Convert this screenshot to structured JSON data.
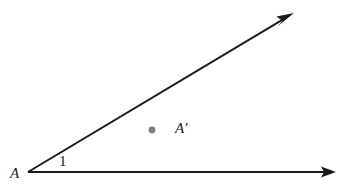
{
  "figure": {
    "background_color": "#ffffff",
    "stroke_color": "#1a1a1a",
    "point_color": "#808080",
    "labels": {
      "vertex": "A",
      "angle": "1",
      "interior_point": "A'"
    },
    "geometry": {
      "vertex": {
        "x": 28,
        "y": 172
      },
      "rays": [
        {
          "name": "horizontal-ray",
          "from": {
            "x": 28,
            "y": 172
          },
          "to": {
            "x": 336,
            "y": 172
          },
          "arrowhead": "end"
        },
        {
          "name": "slanted-ray",
          "from": {
            "x": 28,
            "y": 172
          },
          "to": {
            "x": 294,
            "y": 13
          },
          "arrowhead": "end"
        }
      ],
      "points": [
        {
          "name": "interior-point",
          "label": "A'",
          "x": 152,
          "y": 130,
          "radius": 3.4,
          "color": "#808080"
        }
      ]
    }
  }
}
